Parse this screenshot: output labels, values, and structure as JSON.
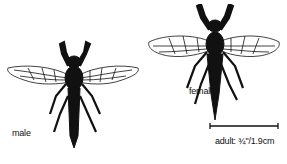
{
  "labels": {
    "male": "male",
    "female": "female",
    "scale": "adult: ¾\"/1.9cm"
  },
  "specimens": [
    {
      "name": "male",
      "icon": "robber-fly-male-illustration"
    },
    {
      "name": "female",
      "icon": "robber-fly-female-illustration"
    }
  ],
  "colors": {
    "ink": "#111111",
    "background": "#ffffff"
  }
}
